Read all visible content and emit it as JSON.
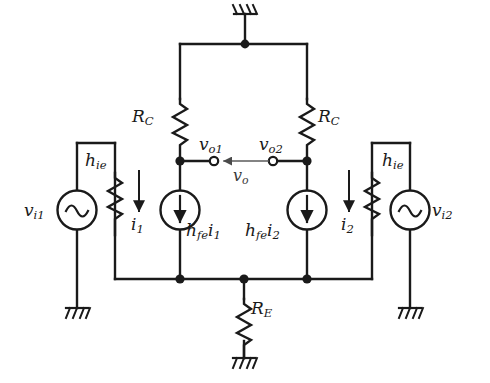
{
  "diagram": {
    "stroke_color": "#1a1a1a",
    "faint_stroke_color": "#8a8a8a",
    "background_color": "#ffffff"
  },
  "labels": {
    "rc_left": {
      "base": "R",
      "sub": "C"
    },
    "rc_right": {
      "base": "R",
      "sub": "C"
    },
    "re": {
      "base": "R",
      "sub": "E"
    },
    "hie_left": {
      "base": "h",
      "sub": "ie"
    },
    "hie_right": {
      "base": "h",
      "sub": "ie"
    },
    "vi1": {
      "base": "v",
      "sub": "i1"
    },
    "vi2": {
      "base": "v",
      "sub": "i2"
    },
    "vo1": {
      "base": "v",
      "sub": "o1"
    },
    "vo2": {
      "base": "v",
      "sub": "o2"
    },
    "vo": {
      "base": "v",
      "sub": "o"
    },
    "i1": {
      "base": "i",
      "sub": "1"
    },
    "i2": {
      "base": "i",
      "sub": "2"
    },
    "hfe_i1": {
      "base": "h",
      "sub": "fe",
      "base2": "i",
      "sub2": "1"
    },
    "hfe_i2": {
      "base": "h",
      "sub": "fe",
      "base2": "i",
      "sub2": "2"
    }
  },
  "components": {
    "resistors": [
      {
        "name": "rc-left",
        "label": "R_C",
        "orientation": "vertical"
      },
      {
        "name": "rc-right",
        "label": "R_C",
        "orientation": "vertical"
      },
      {
        "name": "re",
        "label": "R_E",
        "orientation": "vertical"
      },
      {
        "name": "hie-left",
        "label": "h_ie",
        "orientation": "vertical"
      },
      {
        "name": "hie-right",
        "label": "h_ie",
        "orientation": "vertical"
      }
    ],
    "current_sources": [
      {
        "name": "hfe-i1-source",
        "label": "h_fe i_1",
        "arrow_direction": "down"
      },
      {
        "name": "hfe-i2-source",
        "label": "h_fe i_2",
        "arrow_direction": "down"
      }
    ],
    "voltage_sources": [
      {
        "name": "vi1-source",
        "label": "v_i1",
        "symbol": "sine"
      },
      {
        "name": "vi2-source",
        "label": "v_i2",
        "symbol": "sine"
      }
    ],
    "grounds": [
      {
        "name": "ground-top",
        "orientation": "up"
      },
      {
        "name": "ground-re",
        "orientation": "down"
      },
      {
        "name": "ground-vi1",
        "orientation": "down"
      },
      {
        "name": "ground-vi2",
        "orientation": "down"
      }
    ],
    "terminals": [
      {
        "name": "terminal-vo1",
        "label": "v_o1"
      },
      {
        "name": "terminal-vo2",
        "label": "v_o2"
      }
    ],
    "current_arrows": [
      {
        "name": "current-arrow-i1",
        "label": "i_1",
        "direction": "down"
      },
      {
        "name": "current-arrow-i2",
        "label": "i_2",
        "direction": "down"
      },
      {
        "name": "voltage-arrow-vo",
        "label": "v_o",
        "direction": "left"
      }
    ],
    "junction_dots": 6
  }
}
